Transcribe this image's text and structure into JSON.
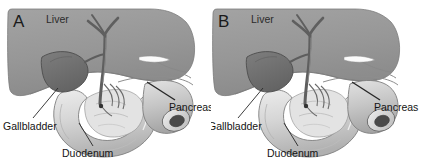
{
  "figure": {
    "type": "medical-illustration",
    "panels": [
      {
        "letter": "A",
        "labels": {
          "liver": "Liver",
          "pancreas": "Pancreas",
          "gallbladder": "Gallbladder",
          "duodenum": "Duodenum"
        }
      },
      {
        "letter": "B",
        "labels": {
          "liver": "Liver",
          "pancreas": "Pancreas",
          "gallbladder": "Gallbladder",
          "duodenum": "Duodenum"
        }
      }
    ],
    "colors": {
      "background": "#ffffff",
      "liver": "#9a9a9a",
      "liver_shadow": "#848484",
      "gallbladder": "#6f6f6f",
      "duct": "#6b6b6b",
      "duodenum": "#d8d8d8",
      "duodenum_shade": "#b4b4b4",
      "pancreas": "#c9c9c9",
      "outline": "#555555",
      "text": "#141414",
      "leader_line": "#2a2a2a"
    }
  }
}
